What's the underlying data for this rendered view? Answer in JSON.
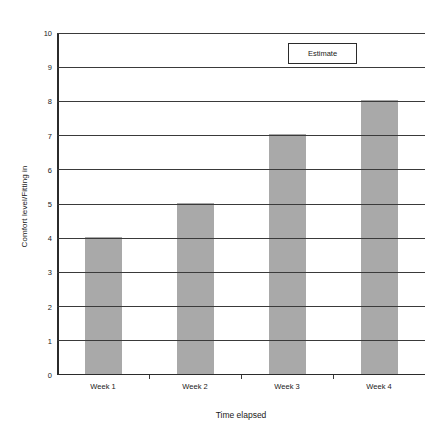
{
  "chart_data": {
    "type": "bar",
    "title": "",
    "categories": [
      "Week 1",
      "Week 2",
      "Week 3",
      "Week 4"
    ],
    "values": [
      4,
      5,
      7,
      8
    ],
    "series": [
      {
        "name": "Estimate",
        "values": [
          4,
          5,
          7,
          8
        ]
      }
    ],
    "xlabel": "Time elapsed",
    "ylabel": "Comfort level/Fitting in",
    "ylim": [
      0,
      10
    ],
    "ytick_labels": [
      "0",
      "1",
      "2",
      "3",
      "4",
      "5",
      "6",
      "7",
      "8",
      "9",
      "10"
    ],
    "ytick_values": [
      0,
      1,
      2,
      3,
      4,
      5,
      6,
      7,
      8,
      9,
      10
    ],
    "grid": true,
    "legend": {
      "entries": [
        "Estimate"
      ],
      "position": "top-right-inside"
    },
    "colors": {
      "bar_fill": "#a9a9a9",
      "axis": "#2b2b2b",
      "gridline": "#3a3a3a",
      "text": "#1a1a1a",
      "background": "#ffffff"
    }
  }
}
